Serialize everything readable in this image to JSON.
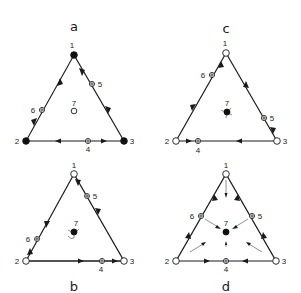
{
  "figure": {
    "panels": [
      {
        "id": "a",
        "label": "a",
        "label_pos": [
          74,
          29
        ],
        "vertices": {
          "1": {
            "pos": [
              74,
              55
            ],
            "type": "filled",
            "label": "1"
          },
          "2": {
            "pos": [
              26,
              141
            ],
            "type": "filled",
            "label": "2"
          },
          "3": {
            "pos": [
              124,
              141
            ],
            "type": "filled",
            "label": "3"
          }
        },
        "edge_points": {
          "5": {
            "pos": [
              92,
              84
            ],
            "type": "saddle",
            "label": "5"
          },
          "6": {
            "pos": [
              42,
              110
            ],
            "type": "saddle",
            "label": "6"
          },
          "4": {
            "pos": [
              88,
              141
            ],
            "type": "saddle",
            "label": "4"
          }
        },
        "center": {
          "label": "7",
          "pos": [
            74,
            111
          ],
          "type": "open"
        }
      },
      {
        "id": "c",
        "label": "c",
        "label_pos": [
          226,
          31
        ],
        "vertices": {
          "1": {
            "pos": [
              226,
              53
            ],
            "type": "open",
            "label": "1"
          },
          "2": {
            "pos": [
              176,
              141
            ],
            "type": "open",
            "label": "2"
          },
          "3": {
            "pos": [
              277,
              141
            ],
            "type": "open",
            "label": "3"
          }
        },
        "edge_points": {
          "6": {
            "pos": [
              212,
              75
            ],
            "type": "saddle",
            "label": "6"
          },
          "5": {
            "pos": [
              264,
              118
            ],
            "type": "saddle",
            "label": "5"
          },
          "4": {
            "pos": [
              198,
              141
            ],
            "type": "saddle",
            "label": "4"
          }
        },
        "center": {
          "label": "7",
          "pos": [
            227,
            112
          ],
          "type": "filled-spiral"
        }
      },
      {
        "id": "b",
        "label": "b",
        "label_pos": [
          74,
          289
        ],
        "vertices": {
          "1": {
            "pos": [
              74,
              174
            ],
            "type": "open",
            "label": "1"
          },
          "2": {
            "pos": [
              26,
              261
            ],
            "type": "open",
            "label": "2"
          },
          "3": {
            "pos": [
              124,
              261
            ],
            "type": "open",
            "label": "3"
          }
        },
        "edge_points": {
          "5": {
            "pos": [
              87,
              196
            ],
            "type": "saddle",
            "label": "5"
          },
          "6": {
            "pos": [
              37,
              239
            ],
            "type": "saddle",
            "label": "6"
          },
          "4": {
            "pos": [
              102,
              261
            ],
            "type": "saddle",
            "label": "4"
          }
        },
        "center": {
          "label": "7",
          "pos": [
            74,
            232
          ],
          "type": "filled-spiral"
        }
      },
      {
        "id": "d",
        "label": "d",
        "label_pos": [
          226,
          289
        ],
        "vertices": {
          "1": {
            "pos": [
              226,
              174
            ],
            "type": "open",
            "label": "1"
          },
          "2": {
            "pos": [
              176,
              261
            ],
            "type": "open",
            "label": "2"
          },
          "3": {
            "pos": [
              276,
              261
            ],
            "type": "open",
            "label": "3"
          }
        },
        "edge_points": {
          "6": {
            "pos": [
              201,
              216
            ],
            "type": "saddle",
            "label": "6"
          },
          "5": {
            "pos": [
              252,
              216
            ],
            "type": "saddle",
            "label": "5"
          },
          "4": {
            "pos": [
              226,
              261
            ],
            "type": "saddle",
            "label": "4"
          }
        },
        "center": {
          "label": "7",
          "pos": [
            226,
            232
          ],
          "type": "filled"
        }
      }
    ]
  }
}
